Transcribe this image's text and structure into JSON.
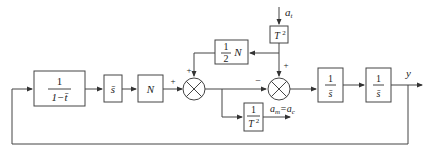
{
  "diagram": {
    "type": "block-diagram",
    "blocks": [
      {
        "id": "prefilter",
        "num": "1",
        "den": "1−t̄"
      },
      {
        "id": "s-bar",
        "label": "s̄"
      },
      {
        "id": "gain-N",
        "label": "N"
      },
      {
        "id": "half-N",
        "num": "1",
        "den": "2",
        "suffix": "N"
      },
      {
        "id": "T2-top",
        "label": "T",
        "sup": "2"
      },
      {
        "id": "inv-T2",
        "num": "1",
        "den": "T",
        "den_sup": "2"
      },
      {
        "id": "integrator-1",
        "num": "1",
        "den": "s̄"
      },
      {
        "id": "integrator-2",
        "num": "1",
        "den": "s̄"
      }
    ],
    "summers": [
      {
        "id": "sum-1",
        "signs": {
          "left": "+",
          "top": "+"
        }
      },
      {
        "id": "sum-2",
        "signs": {
          "left": "−",
          "top": "+"
        }
      }
    ],
    "signals": {
      "target_accel_label": "a",
      "target_accel_sub": "t",
      "missile_accel_label": "a",
      "missile_accel_sub": "m",
      "equals": "=",
      "command_accel_label": "a",
      "command_accel_sub": "c",
      "output_label": "y"
    },
    "sign_plus": "+",
    "sign_minus": "−"
  }
}
